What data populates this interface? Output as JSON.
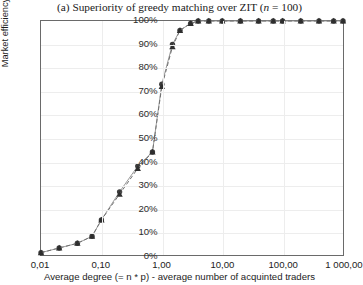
{
  "chart_data": {
    "type": "line",
    "title": "(a) Superiority of greedy matching over ZIT (n = 100)",
    "title_parts": {
      "prefix": "(a) Superiority of greedy matching over ZIT (",
      "italic_var": "n",
      "middle": " = ",
      "n_value": "100",
      "suffix": ")"
    },
    "xlabel": "Average degree (= n * p) - average number of acquinted traders",
    "ylabel": "Market efficiency (%)",
    "xscale": "log",
    "xlim": [
      0.01,
      1000
    ],
    "ylim": [
      0,
      100
    ],
    "grid": true,
    "legend": "none",
    "xticks": [
      "0,01",
      "0,10",
      "1,00",
      "10,00",
      "100,00",
      "1 000,00"
    ],
    "xtick_values": [
      0.01,
      0.1,
      1,
      10,
      100,
      1000
    ],
    "yticks": [
      "0%",
      "10%",
      "20%",
      "30%",
      "40%",
      "50%",
      "60%",
      "70%",
      "80%",
      "90%",
      "100%"
    ],
    "ytick_values": [
      0,
      10,
      20,
      30,
      40,
      50,
      60,
      70,
      80,
      90,
      100
    ],
    "series": [
      {
        "name": "greedy matching",
        "marker": "circle",
        "color": "#3d3d3d",
        "x": [
          0.01,
          0.02,
          0.04,
          0.07,
          0.1,
          0.2,
          0.4,
          0.7,
          1.0,
          1.5,
          2.0,
          3.0,
          4.0,
          6.0,
          10.0,
          20.0,
          40.0,
          70.0,
          100.0,
          200.0,
          400.0,
          700.0,
          1000.0
        ],
        "values": [
          1,
          3,
          5,
          8,
          15,
          27,
          38,
          44,
          73,
          90,
          96,
          99,
          100,
          100,
          100,
          100,
          100,
          100,
          100,
          100,
          100,
          100,
          100
        ]
      },
      {
        "name": "ZIT",
        "marker": "triangle",
        "color": "#2e2e2e",
        "x": [
          0.01,
          0.02,
          0.04,
          0.07,
          0.1,
          0.2,
          0.4,
          0.7,
          1.0,
          1.5,
          2.0,
          3.0,
          4.0,
          6.0,
          10.0,
          20.0,
          40.0,
          70.0,
          100.0,
          200.0,
          400.0,
          700.0,
          1000.0
        ],
        "values": [
          1,
          3,
          5,
          8,
          15,
          26,
          37,
          44,
          72,
          89,
          96,
          99,
          100,
          100,
          100,
          100,
          100,
          100,
          100,
          100,
          100,
          100,
          100
        ]
      }
    ]
  }
}
